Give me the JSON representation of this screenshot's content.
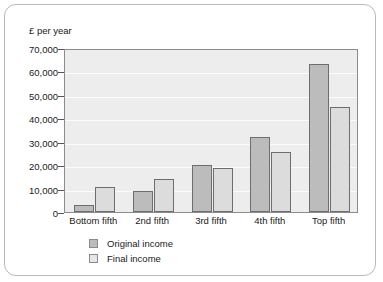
{
  "chart_data": {
    "type": "bar",
    "title": "",
    "subtitle": "",
    "xlabel": "",
    "ylabel": "£ per year",
    "categories": [
      "Bottom fifth",
      "2nd fifth",
      "3rd fifth",
      "4th fifth",
      "Top fifth"
    ],
    "series": [
      {
        "name": "Original income",
        "color": "#bcbcbc",
        "values": [
          3000,
          9000,
          20000,
          32000,
          63000
        ]
      },
      {
        "name": "Final income",
        "color": "#dcdcdc",
        "values": [
          10500,
          14000,
          19000,
          25500,
          45000
        ]
      }
    ],
    "ylim": [
      0,
      70000
    ],
    "ytick_values": [
      0,
      10000,
      20000,
      30000,
      40000,
      50000,
      60000,
      70000
    ],
    "ytick_labels": [
      "0",
      "10,000",
      "20,000",
      "30,000",
      "40,000",
      "50,000",
      "60,000",
      "70,000"
    ],
    "grid": true,
    "grid_axis": "y",
    "legend_position": "bottom-left",
    "plot_background": "#ededed",
    "figure_background": "#ffffff"
  },
  "legend": {
    "items": [
      {
        "label": "Original income",
        "swatch": "original"
      },
      {
        "label": "Final income",
        "swatch": "final"
      }
    ]
  }
}
